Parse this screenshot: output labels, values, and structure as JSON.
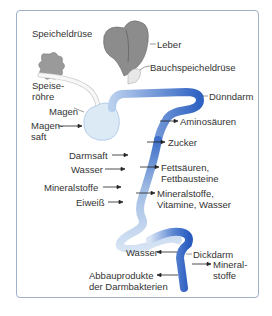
{
  "diagram": {
    "organs": {
      "salivary_gland": "Speicheldrüse",
      "liver": "Leber",
      "pancreas": "Bauchspeicheldrüse",
      "esophagus_line1": "Speise-",
      "esophagus_line2": "röhre",
      "stomach": "Magen",
      "small_intestine": "Dünndarm",
      "large_intestine": "Dickdarm"
    },
    "inputs": {
      "gastric_juice_line1": "Magen-",
      "gastric_juice_line2": "saft",
      "intestinal_juice": "Darmsaft",
      "water": "Wasser",
      "minerals": "Mineralstoffe",
      "protein": "Eiweiß"
    },
    "outputs": {
      "amino_acids": "Aminosäuren",
      "sugar": "Zucker",
      "fats_line1": "Fettsäuren,",
      "fats_line2": "Fettbausteine",
      "minerals_line1": "Mineralstoffe,",
      "minerals_line2": "Vitamine, Wasser",
      "colon_minerals_line1": "Mineral-",
      "colon_minerals_line2": "stoffe"
    },
    "colon_inputs": {
      "water": "Wasser",
      "bacteria_line1": "Abbauprodukte",
      "bacteria_line2": "der Darmbakterien"
    },
    "colors": {
      "frame": "#9fb0c8",
      "organ_gray": "#8a8a8a",
      "intestine_light": "#c9d9ef",
      "intestine_dark": "#2f62c2",
      "stomach": "#dceaf6"
    }
  }
}
